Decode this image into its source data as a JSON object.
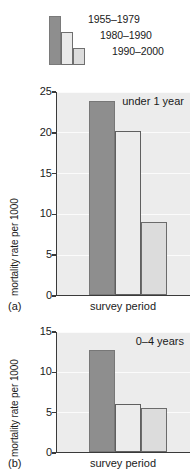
{
  "legend": {
    "entries": [
      {
        "label": "1955–1979",
        "color": "#8e8e8e"
      },
      {
        "label": "1980–1990",
        "color": "#eaeaea"
      },
      {
        "label": "1990–2000",
        "color": "#dcdcdc"
      }
    ]
  },
  "chart_data": [
    {
      "type": "bar",
      "panel": "(a)",
      "title": "under 1 year",
      "categories": [
        "1955–1979",
        "1980–1990",
        "1990–2000"
      ],
      "values": [
        23.8,
        20.1,
        9.0
      ],
      "xlabel": "survey period",
      "ylabel": "mortality rate per 1000",
      "ylim": [
        0,
        25
      ],
      "yticks": [
        0,
        5,
        10,
        15,
        20,
        25
      ],
      "ytick_labels": [
        "0",
        "5",
        "10",
        "15",
        "20",
        "25"
      ],
      "grid": true,
      "legend_position": "above-figure"
    },
    {
      "type": "bar",
      "panel": "(b)",
      "title": "0–4 years",
      "categories": [
        "1955–1979",
        "1980–1990",
        "1990–2000"
      ],
      "values": [
        12.6,
        6.0,
        5.5
      ],
      "xlabel": "survey period",
      "ylabel": "mortality rate per 1000",
      "ylim": [
        0,
        15
      ],
      "yticks": [
        0,
        5,
        10,
        15
      ],
      "ytick_labels": [
        "0",
        "5",
        "10",
        "15"
      ],
      "grid": true,
      "legend_position": "above-figure"
    }
  ]
}
